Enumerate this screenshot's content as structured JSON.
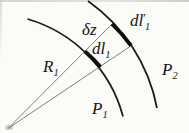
{
  "figure": {
    "colors": {
      "curve": "#1b1b1b",
      "bold_element": "#0d0d0d",
      "ray": "#6f6f6f",
      "apex_smudge": "#9a9a96"
    },
    "labels": {
      "radius": {
        "main": "R",
        "sub": "1"
      },
      "separation": {
        "main": "δz"
      },
      "element_inner": {
        "main": "dl",
        "sub": "1"
      },
      "element_outer": {
        "main": "dl",
        "prime": "′",
        "sub": "1"
      },
      "surface_inner": {
        "main": "P",
        "sub": "1"
      },
      "surface_outer": {
        "main": "P",
        "sub": "2"
      }
    }
  }
}
